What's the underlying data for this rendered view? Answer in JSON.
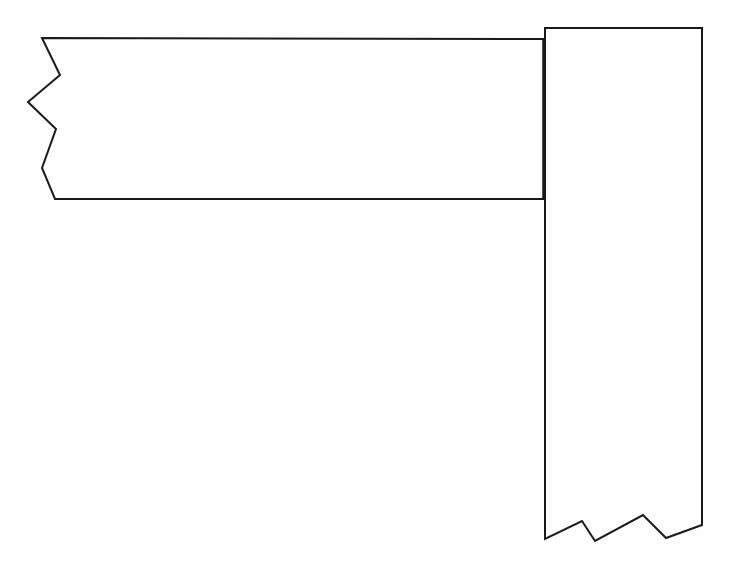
{
  "diagram": {
    "type": "butt-joint",
    "colors": {
      "stroke": "#1a1a1a",
      "background": "#ffffff"
    },
    "horizontal_board": {
      "points": "42,38 544,39 544,199 55,199 42,168 56,129 28,102 60,75"
    },
    "vertical_board": {
      "points": "545,28 702,28 702,525 666,538 643,515 595,541 582,521 545,539"
    },
    "joint_line": {
      "x1": 544,
      "y1": 39,
      "x2": 544,
      "y2": 199
    }
  }
}
